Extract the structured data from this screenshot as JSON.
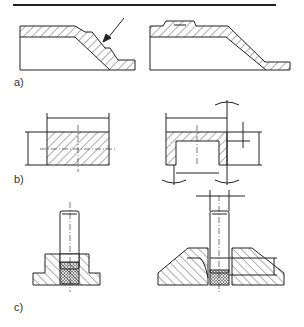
{
  "figure": {
    "labels": {
      "a": "a)",
      "b": "b)",
      "c": "c)"
    },
    "panels": [
      {
        "id": "a",
        "description": "Sheet-metal stepped profile: left with arrow pointing to step, right with raised boss on top flange"
      },
      {
        "id": "b",
        "description": "Rectangular block section with dimensions vs. cap-shaped hollow part with dimension lines and angle arcs"
      },
      {
        "id": "c",
        "description": "Threaded stud in flanged insert (knurled) vs. stud in ribbed conical base with height dimension"
      }
    ],
    "colors": {
      "line": "#222222",
      "hatch": "#333333",
      "background": "#ffffff"
    }
  }
}
